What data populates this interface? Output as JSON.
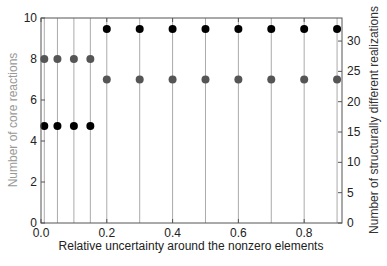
{
  "chart_data": {
    "type": "scatter",
    "subtype": "stem-dual-axis",
    "title": "",
    "xlabel": "Relative uncertainty around the nonzero elements",
    "ylabel_left": "Number of core reactions",
    "ylabel_right": "Number of structurally different realizations",
    "xlim": [
      0,
      0.915
    ],
    "ylim_left": [
      0,
      10
    ],
    "ylim_right": [
      0,
      33.8
    ],
    "x_ticks": [
      "0.0",
      "0.2",
      "0.4",
      "0.6",
      "0.8"
    ],
    "x_tick_values": [
      0,
      0.2,
      0.4,
      0.6,
      0.8
    ],
    "y_left_ticks": [
      "0",
      "2",
      "4",
      "6",
      "8",
      "10"
    ],
    "y_left_tick_values": [
      0,
      2,
      4,
      6,
      8,
      10
    ],
    "y_right_ticks": [
      "0",
      "5",
      "10",
      "15",
      "20",
      "25",
      "30"
    ],
    "y_right_tick_values": [
      0,
      5,
      10,
      15,
      20,
      25,
      30
    ],
    "grid": false,
    "legend": null,
    "x": [
      0.01,
      0.05,
      0.1,
      0.15,
      0.2,
      0.3,
      0.4,
      0.5,
      0.6,
      0.7,
      0.8,
      0.9
    ],
    "series": [
      {
        "name": "Number of core reactions",
        "axis": "left",
        "color": "#555555",
        "values": [
          8,
          8,
          8,
          8,
          7,
          7,
          7,
          7,
          7,
          7,
          7,
          7
        ]
      },
      {
        "name": "Number of structurally different realizations",
        "axis": "right",
        "color": "#000000",
        "values": [
          16,
          16,
          16,
          16,
          32,
          32,
          32,
          32,
          32,
          32,
          32,
          32
        ]
      }
    ]
  },
  "colors": {
    "left_axis_title": "#999999",
    "right_axis_title": "#333333",
    "stem": "#aaaaaa",
    "frame": "#555555"
  }
}
